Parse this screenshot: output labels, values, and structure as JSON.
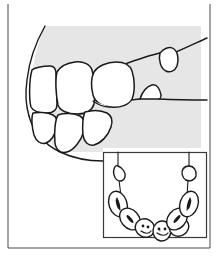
{
  "figure": {
    "caption": "",
    "type": "line-drawing",
    "width": 219,
    "height": 257,
    "background_color": "#ffffff",
    "shade_color": "#e6e6e6",
    "line_color": "#1a1a1a",
    "frame_color": "#4a4a4a"
  },
  "frame": {
    "name": "outer-border",
    "left": 8,
    "top": 4,
    "right": 210,
    "bottom": 248,
    "stroke": "#4a4a4a"
  },
  "main_view": {
    "name": "buccal-lateral-view",
    "description": "Lateral (buccal) view of posterior teeth with shaded jaw region",
    "shaded_region_label": "jaw-shading",
    "teeth": [
      {
        "id": "upper-molar-distal",
        "label": "upper posterior molar",
        "position": "upper-left"
      },
      {
        "id": "upper-molar-mesial",
        "label": "upper molar",
        "position": "upper-left-center"
      },
      {
        "id": "upper-premolar",
        "label": "upper premolar",
        "position": "upper-center"
      },
      {
        "id": "lower-molar-distal",
        "label": "lower posterior molar",
        "position": "lower-left"
      },
      {
        "id": "lower-molar-mesial",
        "label": "lower molar",
        "position": "lower-left-center"
      },
      {
        "id": "lower-premolar",
        "label": "lower premolar",
        "position": "lower-center"
      },
      {
        "id": "upper-cusp-right",
        "label": "opposing upper cusp",
        "position": "upper-right"
      },
      {
        "id": "lower-cusp-right",
        "label": "opposing lower cusp",
        "position": "center-right"
      }
    ],
    "occlusal_line_label": "occlusal-plane-line"
  },
  "inset": {
    "name": "occlusal-arch-inset",
    "description": "Occlusal (top-down) view of the dental arch",
    "box": {
      "left": 103,
      "top": 152,
      "right": 207,
      "bottom": 238
    },
    "arch_teeth": [
      {
        "id": "arch-left-posterior",
        "label": "left posterior molar"
      },
      {
        "id": "arch-left-molar",
        "label": "left molar"
      },
      {
        "id": "arch-left-premolar",
        "label": "left premolar"
      },
      {
        "id": "arch-central-left",
        "label": "left central tooth"
      },
      {
        "id": "arch-central-right",
        "label": "right central tooth"
      },
      {
        "id": "arch-right-premolar",
        "label": "right premolar"
      },
      {
        "id": "arch-right-molar",
        "label": "right molar"
      },
      {
        "id": "arch-right-posterior",
        "label": "right posterior molar"
      }
    ],
    "callout_shapes": [
      {
        "id": "callout-left",
        "label": "left reference tooth outline"
      },
      {
        "id": "callout-right",
        "label": "right reference tooth outline"
      }
    ],
    "connector_lines": 2
  }
}
